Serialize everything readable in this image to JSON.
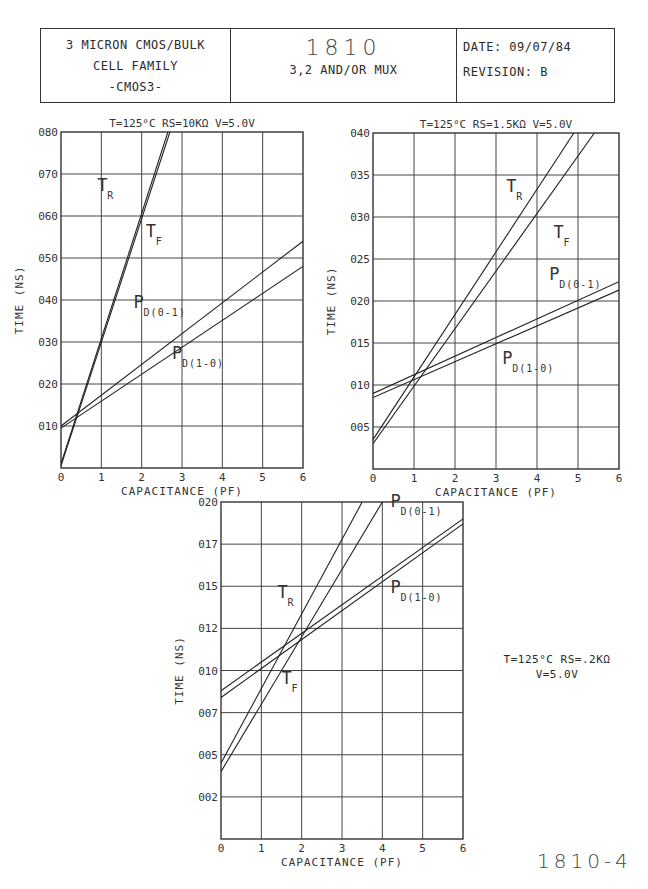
{
  "header": {
    "left": {
      "line1": "3 MICRON CMOS/BULK",
      "line2": "CELL FAMILY",
      "line3": "-CMOS3-"
    },
    "center": {
      "part_number": "1810",
      "description": "3,2 AND/OR MUX"
    },
    "right": {
      "date_label": "DATE:",
      "date": "09/07/84",
      "revision_label": "REVISION:",
      "revision": "B"
    }
  },
  "side_condition": {
    "line1": "T=125°C  RS=.2KΩ",
    "line2": "V=5.0V"
  },
  "figure_number": "1810-4",
  "chart_data": [
    {
      "type": "line",
      "title": "T=125°C RS=10KΩ V=5.0V",
      "xlabel": "CAPACITANCE (PF)",
      "ylabel": "TIME (NS)",
      "xlim": [
        0,
        6
      ],
      "ylim": [
        0,
        0.8
      ],
      "x_ticks": [
        "0",
        "1",
        "2",
        "3",
        "4",
        "5",
        "6"
      ],
      "y_ticks": [
        "010",
        "020",
        "030",
        "040",
        "050",
        "060",
        "070",
        "080"
      ],
      "grid": true,
      "series": [
        {
          "name": "TR",
          "label": "T",
          "sub": "R",
          "x": [
            0,
            2.65
          ],
          "values": [
            0.01,
            0.8
          ]
        },
        {
          "name": "TF",
          "label": "T",
          "sub": "F",
          "x": [
            0,
            2.7
          ],
          "values": [
            0.005,
            0.8
          ]
        },
        {
          "name": "PD(0-1)",
          "label": "P",
          "sub": "D(0-1)",
          "x": [
            0,
            6
          ],
          "values": [
            0.1,
            0.54
          ]
        },
        {
          "name": "PD(1-0)",
          "label": "P",
          "sub": "D(1-0)",
          "x": [
            0,
            6
          ],
          "values": [
            0.095,
            0.48
          ]
        }
      ]
    },
    {
      "type": "line",
      "title": "T=125°C RS=1.5KΩ V=5.0V",
      "xlabel": "CAPACITANCE (PF)",
      "ylabel": "TIME (NS)",
      "xlim": [
        0,
        6
      ],
      "ylim": [
        0,
        0.4
      ],
      "x_ticks": [
        "0",
        "1",
        "2",
        "3",
        "4",
        "5",
        "6"
      ],
      "y_ticks": [
        "005",
        "010",
        "015",
        "020",
        "025",
        "030",
        "035",
        "040"
      ],
      "grid": true,
      "series": [
        {
          "name": "TR",
          "label": "T",
          "sub": "R",
          "x": [
            0,
            4.9
          ],
          "values": [
            0.035,
            0.4
          ]
        },
        {
          "name": "TF",
          "label": "T",
          "sub": "F",
          "x": [
            0,
            5.4
          ],
          "values": [
            0.03,
            0.4
          ]
        },
        {
          "name": "PD(0-1)",
          "label": "P",
          "sub": "D(0-1)",
          "x": [
            0,
            6
          ],
          "values": [
            0.09,
            0.223
          ]
        },
        {
          "name": "PD(1-0)",
          "label": "P",
          "sub": "D(1-0)",
          "x": [
            0,
            6
          ],
          "values": [
            0.085,
            0.213
          ]
        }
      ]
    },
    {
      "type": "line",
      "title": "T=125°C RS=.2KΩ V=5.0V",
      "xlabel": "CAPACITANCE (PF)",
      "ylabel": "TIME (NS)",
      "xlim": [
        0,
        6
      ],
      "ylim": [
        0,
        0.2
      ],
      "x_ticks": [
        "0",
        "1",
        "2",
        "3",
        "4",
        "5",
        "6"
      ],
      "y_ticks": [
        "002",
        "005",
        "007",
        "010",
        "012",
        "015",
        "017",
        "020"
      ],
      "grid": true,
      "series": [
        {
          "name": "TR",
          "label": "T",
          "sub": "R",
          "x": [
            0,
            3.5
          ],
          "values": [
            0.045,
            0.2
          ]
        },
        {
          "name": "TF",
          "label": "T",
          "sub": "F",
          "x": [
            0,
            4.0
          ],
          "values": [
            0.04,
            0.2
          ]
        },
        {
          "name": "PD(0-1)",
          "label": "P",
          "sub": "D(0-1)",
          "x": [
            0,
            6
          ],
          "values": [
            0.088,
            0.19
          ]
        },
        {
          "name": "PD(1-0)",
          "label": "P",
          "sub": "D(1-0)",
          "x": [
            0,
            6
          ],
          "values": [
            0.084,
            0.187
          ]
        }
      ]
    }
  ],
  "charts_layout": [
    {
      "left": 61,
      "top": 132,
      "width": 242,
      "height": 336,
      "labels": [
        {
          "i": 0,
          "x": 0.9,
          "y": 0.66
        },
        {
          "i": 1,
          "x": 2.1,
          "y": 0.55
        },
        {
          "i": 2,
          "x": 1.8,
          "y": 0.38
        },
        {
          "i": 3,
          "x": 2.75,
          "y": 0.26
        }
      ]
    },
    {
      "left": 373,
      "top": 133,
      "width": 246,
      "height": 336,
      "labels": [
        {
          "i": 0,
          "x": 3.25,
          "y": 0.33
        },
        {
          "i": 1,
          "x": 4.4,
          "y": 0.275
        },
        {
          "i": 2,
          "x": 4.3,
          "y": 0.225
        },
        {
          "i": 3,
          "x": 3.15,
          "y": 0.125
        }
      ]
    },
    {
      "left": 221,
      "top": 502,
      "width": 242,
      "height": 337,
      "labels": [
        {
          "i": 0,
          "x": 1.4,
          "y": 0.143
        },
        {
          "i": 1,
          "x": 1.5,
          "y": 0.092
        },
        {
          "i": 2,
          "x": 4.2,
          "y": 0.197
        },
        {
          "i": 3,
          "x": 4.2,
          "y": 0.146
        }
      ]
    }
  ]
}
